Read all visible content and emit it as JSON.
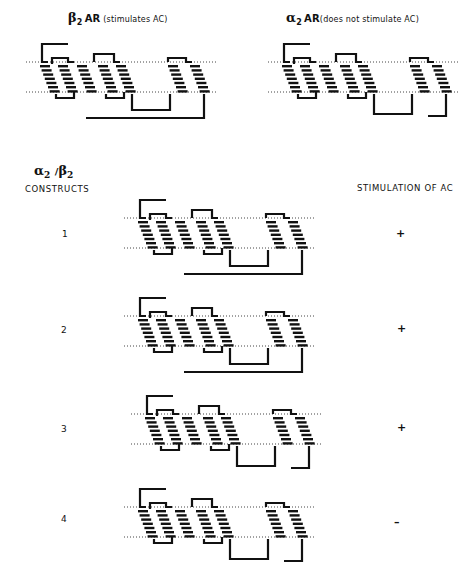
{
  "figure": {
    "top_left": {
      "symbol": "β",
      "subscript": "2",
      "name": "AR",
      "note": "(stimulates AC)",
      "variant": "beta2"
    },
    "top_right": {
      "symbol": "α",
      "subscript": "2",
      "name": "AR",
      "note": "(does not stimulate AC)",
      "variant": "alpha2"
    },
    "constructs_header": {
      "symbol_a": "α",
      "sub_a": "2",
      "slash": "/",
      "symbol_b": "β",
      "sub_b": "2",
      "label": "CONSTRUCTS"
    },
    "stimulation_header": "STIMULATION OF AC",
    "constructs": [
      {
        "number": "1",
        "stimulation": "+",
        "variant": "beta2"
      },
      {
        "number": "2",
        "stimulation": "+",
        "variant": "beta2"
      },
      {
        "number": "3",
        "stimulation": "+",
        "variant": "alpha2"
      },
      {
        "number": "4",
        "stimulation": "–",
        "variant": "alpha2"
      }
    ]
  },
  "colors": {
    "ink": "#111111",
    "membrane": "#444444",
    "background": "#ffffff"
  }
}
